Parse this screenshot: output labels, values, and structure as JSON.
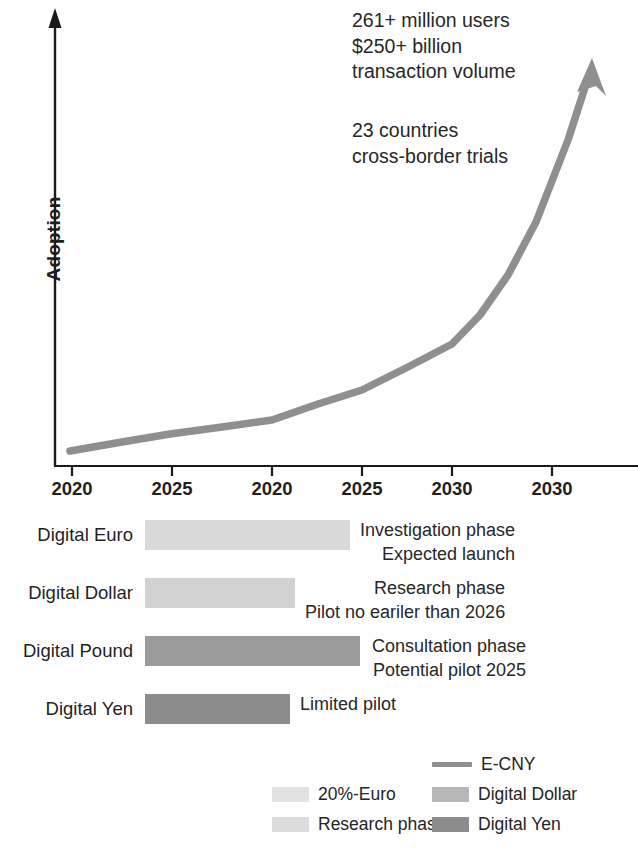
{
  "chart_data": [
    {
      "type": "line",
      "title": "",
      "xlabel": "",
      "ylabel": "Adoption",
      "grid": false,
      "legend_position": "bottom-right",
      "x_tick_labels": [
        "2020",
        "2025",
        "2020",
        "2025",
        "2030",
        "2030"
      ],
      "x_tick_positions_px": [
        72,
        172,
        272,
        362,
        452,
        552
      ],
      "series": [
        {
          "name": "E-CNY",
          "color": "#8f8f8f",
          "points_px": [
            [
              70,
              451
            ],
            [
              170,
              434
            ],
            [
              272,
              420
            ],
            [
              362,
              390
            ],
            [
              452,
              344
            ],
            [
              500,
              300
            ],
            [
              552,
              200
            ],
            [
              591,
              66
            ]
          ],
          "arrow_head": true
        }
      ],
      "annotations": [
        {
          "id": "stats",
          "lines": [
            "261+ million users",
            "$250+ billion",
            "transaction volume"
          ]
        },
        {
          "id": "countries",
          "lines": [
            "23 countries",
            "cross-border trials"
          ]
        }
      ]
    },
    {
      "type": "bar",
      "orientation": "horizontal",
      "title": "",
      "categories": [
        "Digital Euro",
        "Digital Dollar",
        "Digital Pound",
        "Digital Yen"
      ],
      "values": [
        205,
        150,
        215,
        145
      ],
      "value_unit": "px-length",
      "bar_colors": [
        "#d9d9d9",
        "#d2d2d2",
        "#9b9b9b",
        "#8c8c8c"
      ],
      "annotations": [
        [
          "Investigation phase",
          "Expected launch"
        ],
        [
          "Research phase",
          "Pilot no eariler than 2026"
        ],
        [
          "Consultation phase",
          "Potential pilot 2025"
        ],
        [
          "Limited pilot"
        ]
      ]
    }
  ],
  "line_chart": {
    "y_axis_label": "Adoption",
    "annotation_stats": "261+ million users\n$250+ billion\ntransaction volume",
    "annotation_countries": "23 countries\ncross-border trials",
    "ticks": [
      {
        "label": "2020"
      },
      {
        "label": "2025"
      },
      {
        "label": "2020"
      },
      {
        "label": "2025"
      },
      {
        "label": "2030"
      },
      {
        "label": "2030"
      }
    ]
  },
  "bars": {
    "rows": [
      {
        "category": "Digital Euro",
        "color": "#d9d9d9",
        "width_px": 205,
        "desc": "Investigation phase\nExpected launch",
        "desc_left": 360,
        "desc_top": 2
      },
      {
        "category": "Digital Dollar",
        "color": "#d2d2d2",
        "width_px": 150,
        "desc": "Research phase\nPilot no eariler than 2026",
        "desc_left": 305,
        "desc_top": 2
      },
      {
        "category": "Digital Pound",
        "color": "#9b9b9b",
        "width_px": 215,
        "desc": "Consultation phase\nPotential pilot 2025",
        "desc_left": 372,
        "desc_top": 2
      },
      {
        "category": "Digital Yen",
        "color": "#8c8c8c",
        "width_px": 145,
        "desc": "Limited pilot",
        "desc_left": 300,
        "desc_top": 2
      }
    ]
  },
  "legend": {
    "entries": [
      {
        "label": "E-CNY",
        "kind": "line",
        "color": "#8f8f8f",
        "left": 432,
        "top": 6
      },
      {
        "label": "20%-Euro",
        "kind": "swatch",
        "color": "#e2e2e2",
        "left": 272,
        "top": 36
      },
      {
        "label": "Digital Dollar",
        "kind": "swatch",
        "color": "#b7b7b7",
        "left": 432,
        "top": 36
      },
      {
        "label": "Research phase",
        "kind": "swatch",
        "color": "#dcdcdc",
        "left": 272,
        "top": 66
      },
      {
        "label": "Digital Yen",
        "kind": "swatch",
        "color": "#8c8c8c",
        "left": 432,
        "top": 66
      }
    ]
  },
  "colors": {
    "axis": "#1a1a1a",
    "line_series": "#8f8f8f",
    "text": "#232323",
    "background": "#ffffff"
  }
}
